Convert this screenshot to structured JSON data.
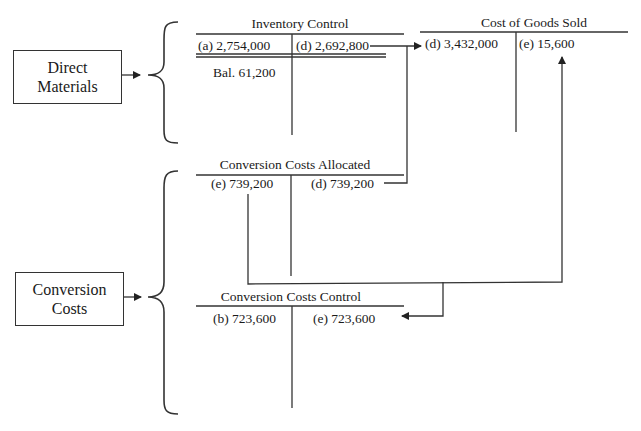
{
  "sources": {
    "direct_materials": {
      "line1": "Direct",
      "line2": "Materials"
    },
    "conversion_costs": {
      "line1": "Conversion",
      "line2": "Costs"
    }
  },
  "accounts": {
    "inventory_control": {
      "title": "Inventory Control",
      "debit": [
        {
          "label": "(a)",
          "amount": "2,754,000"
        }
      ],
      "credit": [
        {
          "label": "(d)",
          "amount": "2,692,800"
        }
      ],
      "balance": "Bal. 61,200"
    },
    "cost_of_goods_sold": {
      "title": "Cost of Goods Sold",
      "debit": [
        {
          "label": "(d)",
          "amount": "3,432,000"
        }
      ],
      "credit": [
        {
          "label": "(e)",
          "amount": "15,600"
        }
      ]
    },
    "conversion_costs_allocated": {
      "title": "Conversion Costs Allocated",
      "debit": [
        {
          "label": "(e)",
          "amount": "739,200"
        }
      ],
      "credit": [
        {
          "label": "(d)",
          "amount": "739,200"
        }
      ]
    },
    "conversion_costs_control": {
      "title": "Conversion Costs Control",
      "debit": [
        {
          "label": "(b)",
          "amount": "723,600"
        }
      ],
      "credit": [
        {
          "label": "(e)",
          "amount": "723,600"
        }
      ]
    }
  },
  "display": {
    "ic_debit": "(a)  2,754,000",
    "ic_credit": "(d)  2,692,800",
    "cogs_debit": "(d) 3,432,000",
    "cogs_credit": "(e)  15,600",
    "cca_debit": "(e) 739,200",
    "cca_credit": "(d) 739,200",
    "ccc_debit": "(b) 723,600",
    "ccc_credit": "(e) 723,600"
  },
  "colors": {
    "line": "#333333",
    "text": "#1a1a1a",
    "background": "#ffffff"
  }
}
